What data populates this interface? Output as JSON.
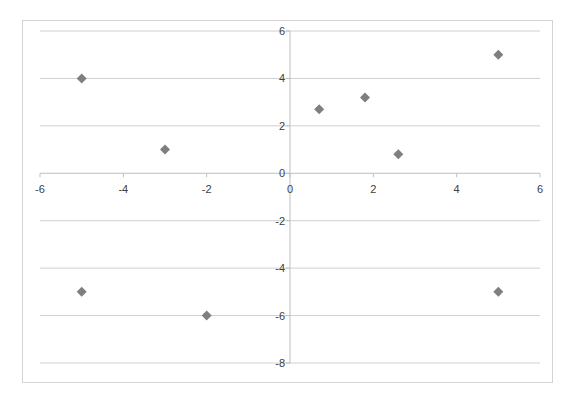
{
  "chart_data": {
    "type": "scatter",
    "title": "",
    "xlabel": "",
    "ylabel": "",
    "xlim": [
      -6,
      6
    ],
    "ylim": [
      -8,
      6
    ],
    "grid": {
      "horizontal": true,
      "vertical": false
    },
    "legend": null,
    "x_ticks": [
      -6,
      -4,
      -2,
      0,
      2,
      4,
      6
    ],
    "y_ticks": [
      6,
      4,
      2,
      0,
      -2,
      -4,
      -6,
      -8
    ],
    "marker": "diamond",
    "marker_color": "#7f7f7f",
    "series": [
      {
        "name": "Series1",
        "points": [
          {
            "x": -5,
            "y": 4
          },
          {
            "x": -3,
            "y": 1
          },
          {
            "x": 0.7,
            "y": 2.7
          },
          {
            "x": 1.8,
            "y": 3.2
          },
          {
            "x": 2.6,
            "y": 0.8
          },
          {
            "x": 5,
            "y": 5
          },
          {
            "x": -5,
            "y": -5
          },
          {
            "x": -2,
            "y": -6
          },
          {
            "x": 5,
            "y": -5
          }
        ]
      }
    ]
  },
  "colors": {
    "gridline": "#d0d0d0",
    "axis": "#bfbfbf",
    "label": "#404040",
    "frame": "#d4d4d4"
  }
}
